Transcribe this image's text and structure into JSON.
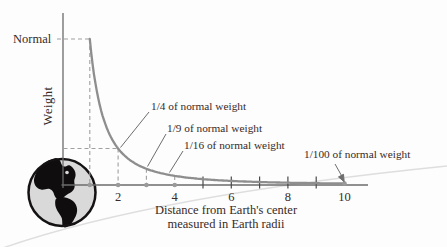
{
  "labels": {
    "normal": "Normal",
    "weight_axis": "Weight",
    "x_caption_line1": "Distance from Earth's center",
    "x_caption_line2": "measured in Earth radii"
  },
  "chart_data": {
    "type": "line",
    "title": "",
    "xlabel": "Distance from Earth's center measured in Earth radii",
    "ylabel": "Weight",
    "relation": "weight = 1 / distance^2 (inverse-square law)",
    "x_range": [
      1,
      10
    ],
    "y_reference": {
      "label": "Normal",
      "value": 1
    },
    "curve_points": [
      {
        "d": 1,
        "w": 1.0
      },
      {
        "d": 2,
        "w": 0.25
      },
      {
        "d": 3,
        "w": 0.1111
      },
      {
        "d": 4,
        "w": 0.0625
      },
      {
        "d": 5,
        "w": 0.04
      },
      {
        "d": 6,
        "w": 0.0278
      },
      {
        "d": 7,
        "w": 0.0204
      },
      {
        "d": 8,
        "w": 0.0156
      },
      {
        "d": 9,
        "w": 0.0123
      },
      {
        "d": 10,
        "w": 0.01
      }
    ],
    "x_ticks_labeled": [
      2,
      4,
      6,
      8,
      10
    ],
    "x_ticks_minor": [
      5,
      6,
      7,
      8,
      9
    ],
    "guide_dashed_x": [
      1,
      2,
      3,
      4
    ],
    "axis_dots_x": [
      1,
      2,
      3,
      4
    ],
    "curve_dot_x": [
      10
    ],
    "annotations": [
      {
        "label": "1/4 of normal weight",
        "d": 2,
        "w": 0.25
      },
      {
        "label": "1/9 of normal weight",
        "d": 3,
        "w": 0.1111
      },
      {
        "label": "1/16 of normal weight",
        "d": 4,
        "w": 0.0625
      },
      {
        "label": "1/100 of normal weight",
        "d": 10,
        "w": 0.01
      }
    ],
    "colors": {
      "curve": "#8e8e8e",
      "axis": "#6b6b6b",
      "tick": "#4a4a4a",
      "dashed": "#9f9f9f",
      "dot": "#9a9a9a",
      "text": "#372a27",
      "earth_fill": "#d9d9d9",
      "earth_land": "#0f0d0d",
      "earth_outline": "#141212"
    }
  }
}
